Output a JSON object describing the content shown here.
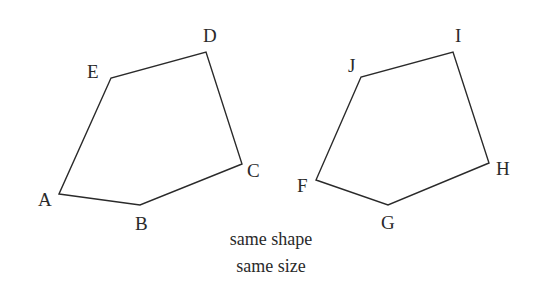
{
  "diagram": {
    "shapes": [
      {
        "name": "ABCDE",
        "vertices": [
          {
            "label": "A",
            "x": 59,
            "y": 194,
            "lx": 38,
            "ly": 206
          },
          {
            "label": "B",
            "x": 140,
            "y": 205,
            "lx": 135,
            "ly": 230
          },
          {
            "label": "C",
            "x": 242,
            "y": 164,
            "lx": 247,
            "ly": 177
          },
          {
            "label": "D",
            "x": 206,
            "y": 52,
            "lx": 203,
            "ly": 42
          },
          {
            "label": "E",
            "x": 111,
            "y": 78,
            "lx": 87,
            "ly": 78
          }
        ]
      },
      {
        "name": "FGHIJ",
        "vertices": [
          {
            "label": "F",
            "x": 316,
            "y": 180,
            "lx": 297,
            "ly": 192
          },
          {
            "label": "G",
            "x": 388,
            "y": 205,
            "lx": 381,
            "ly": 229
          },
          {
            "label": "H",
            "x": 489,
            "y": 163,
            "lx": 496,
            "ly": 175
          },
          {
            "label": "I",
            "x": 453,
            "y": 52,
            "lx": 455,
            "ly": 42
          },
          {
            "label": "J",
            "x": 361,
            "y": 77,
            "lx": 348,
            "ly": 72
          }
        ]
      }
    ],
    "caption": {
      "line1": "same shape",
      "line2": "same size"
    },
    "colors": {
      "stroke": "#2a2a2a",
      "background": "#ffffff"
    }
  }
}
